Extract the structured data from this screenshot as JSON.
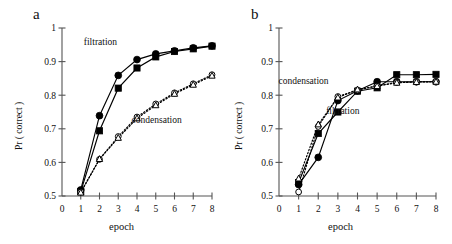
{
  "figure": {
    "panels": [
      {
        "id": "a",
        "label": "a",
        "annotations": [
          {
            "text": "filtration",
            "x": 2.05,
            "y": 0.948
          },
          {
            "text": "condensation",
            "x": 5.05,
            "y": 0.718
          }
        ]
      },
      {
        "id": "b",
        "label": "b",
        "annotations": [
          {
            "text": "condensation",
            "x": 1.25,
            "y": 0.833
          },
          {
            "text": "filtration",
            "x": 3.25,
            "y": 0.745
          }
        ]
      }
    ]
  },
  "chart_data": [
    {
      "type": "line",
      "panel": "a",
      "title": "a",
      "xlabel": "epoch",
      "ylabel": "Pr ( correct )",
      "xlim": [
        0,
        8
      ],
      "ylim": [
        0.5,
        1.0
      ],
      "xticks": [
        0,
        1,
        2,
        3,
        4,
        5,
        6,
        7,
        8
      ],
      "xticklabels": [
        "0",
        "1",
        "2",
        "3",
        "4",
        "5",
        "6",
        "7",
        "8"
      ],
      "yticks": [
        0.5,
        0.6,
        0.7,
        0.8,
        0.9,
        1.0
      ],
      "yticklabels": [
        "0.5",
        "0.6",
        "0.7",
        "0.8",
        "0.9",
        "1"
      ],
      "grid": false,
      "legend": "annotations-inline",
      "x": [
        1,
        2,
        3,
        4,
        5,
        6,
        7,
        8
      ],
      "series": [
        {
          "name": "filtration-circle",
          "condition": "filtration",
          "marker": "filled-circle",
          "line": "solid",
          "values": [
            0.518,
            0.739,
            0.859,
            0.906,
            0.923,
            0.932,
            0.941,
            0.947
          ]
        },
        {
          "name": "filtration-square",
          "condition": "filtration",
          "marker": "filled-square",
          "line": "solid",
          "values": [
            0.513,
            0.694,
            0.821,
            0.881,
            0.914,
            0.93,
            0.938,
            0.946
          ]
        },
        {
          "name": "condensation-circle",
          "condition": "condensation",
          "marker": "open-circle",
          "line": "dotted",
          "values": [
            0.512,
            0.609,
            0.677,
            0.735,
            0.774,
            0.807,
            0.834,
            0.861
          ]
        },
        {
          "name": "condensation-triangle",
          "condition": "condensation",
          "marker": "open-triangle",
          "line": "dotted",
          "values": [
            0.51,
            0.61,
            0.673,
            0.731,
            0.77,
            0.804,
            0.831,
            0.858
          ]
        }
      ]
    },
    {
      "type": "line",
      "panel": "b",
      "title": "b",
      "xlabel": "epoch",
      "ylabel": "Pr ( correct )",
      "xlim": [
        0,
        8
      ],
      "ylim": [
        0.5,
        1.0
      ],
      "xticks": [
        0,
        1,
        2,
        3,
        4,
        5,
        6,
        7,
        8
      ],
      "xticklabels": [
        "0",
        "1",
        "2",
        "3",
        "4",
        "5",
        "6",
        "7",
        "8"
      ],
      "yticks": [
        0.5,
        0.6,
        0.7,
        0.8,
        0.9,
        1.0
      ],
      "yticklabels": [
        "0.5",
        "0.6",
        "0.7",
        "0.8",
        "0.9",
        "1"
      ],
      "grid": false,
      "legend": "annotations-inline",
      "x": [
        1,
        2,
        3,
        4,
        5,
        6,
        7,
        8
      ],
      "series": [
        {
          "name": "filtration-circle",
          "condition": "filtration",
          "marker": "filled-circle",
          "line": "solid",
          "values": [
            0.534,
            0.615,
            0.784,
            0.813,
            0.84,
            0.84,
            0.84,
            0.84
          ]
        },
        {
          "name": "filtration-square",
          "condition": "filtration",
          "marker": "filled-square",
          "line": "solid",
          "values": [
            0.54,
            0.686,
            0.75,
            0.812,
            0.822,
            0.861,
            0.861,
            0.862
          ]
        },
        {
          "name": "condensation-circle",
          "condition": "condensation",
          "marker": "open-circle",
          "line": "dotted",
          "values": [
            0.512,
            0.707,
            0.796,
            0.815,
            0.828,
            0.838,
            0.84,
            0.841
          ]
        },
        {
          "name": "condensation-triangle",
          "condition": "condensation",
          "marker": "open-triangle",
          "line": "dotted",
          "values": [
            0.552,
            0.713,
            0.793,
            0.817,
            0.827,
            0.837,
            0.839,
            0.84
          ]
        }
      ]
    }
  ]
}
